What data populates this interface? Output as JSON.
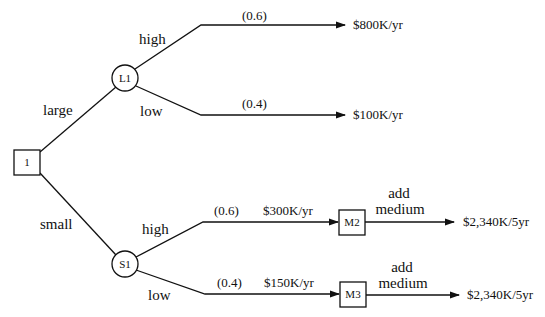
{
  "diagram": {
    "type": "decision-tree",
    "nodes": {
      "root": {
        "label": "1",
        "shape": "square",
        "kind": "decision"
      },
      "l1": {
        "label": "L1",
        "shape": "circle",
        "kind": "chance"
      },
      "s1": {
        "label": "S1",
        "shape": "circle",
        "kind": "chance"
      },
      "m2": {
        "label": "M2",
        "shape": "square",
        "kind": "decision"
      },
      "m3": {
        "label": "M3",
        "shape": "square",
        "kind": "decision"
      }
    },
    "edges": {
      "root_l1": {
        "label": "large"
      },
      "root_s1": {
        "label": "small"
      },
      "l1_high": {
        "label": "high",
        "probability": "(0.6)",
        "outcome": "$800K/yr"
      },
      "l1_low": {
        "label": "low",
        "probability": "(0.4)",
        "outcome": "$100K/yr"
      },
      "s1_high": {
        "label": "high",
        "probability": "(0.6)",
        "value": "$300K/yr"
      },
      "s1_low": {
        "label": "low",
        "probability": "(0.4)",
        "value": "$150K/yr"
      },
      "m2_add": {
        "label_line1": "add",
        "label_line2": "medium",
        "outcome": "$2,340K/5yr"
      },
      "m3_add": {
        "label_line1": "add",
        "label_line2": "medium",
        "outcome": "$2,340K/5yr"
      }
    },
    "colors": {
      "line": "#111111",
      "background": "#ffffff"
    }
  }
}
